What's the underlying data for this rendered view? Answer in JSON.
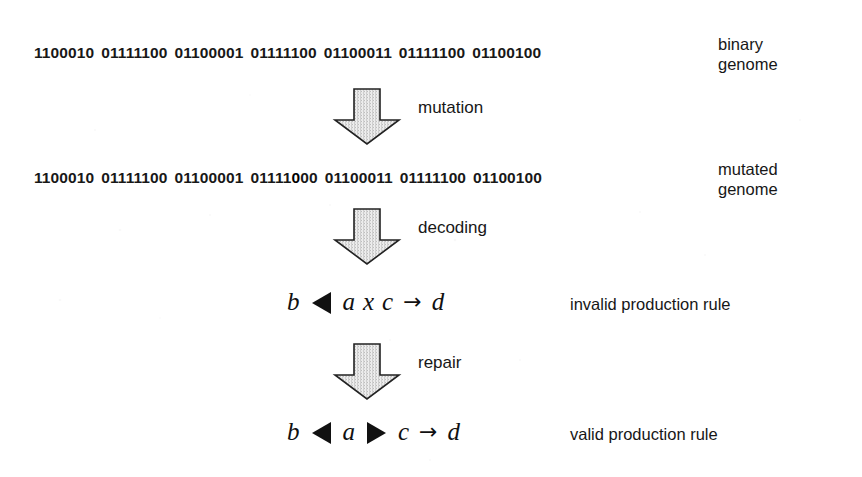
{
  "figure": {
    "background_color": "#ffffff",
    "ink_color": "#171717",
    "arrow_fill_light": "#f2f2f2",
    "arrow_fill_dark": "#b9b9b9",
    "arrow_stroke": "#222222"
  },
  "genomes": {
    "binary": {
      "groups": [
        "1100010",
        "01111100",
        "01100001",
        "01111100",
        "01100011",
        "01111100",
        "01100100"
      ],
      "label_line1": "binary",
      "label_line2": "genome"
    },
    "mutated": {
      "groups_before": [
        "1100010",
        "01111100",
        "01100001"
      ],
      "mutated_group": {
        "prefix": "01111",
        "mutated_bit": "0",
        "suffix": "00"
      },
      "groups_after": [
        "01100011",
        "01111100",
        "01100100"
      ],
      "label_line1": "mutated",
      "label_line2": "genome"
    }
  },
  "stages": [
    {
      "name": "mutation",
      "label": "mutation",
      "icon": "down-block-arrow-icon"
    },
    {
      "name": "decoding",
      "label": "decoding",
      "icon": "down-block-arrow-icon"
    },
    {
      "name": "repair",
      "label": "repair",
      "icon": "down-block-arrow-icon"
    }
  ],
  "rules": {
    "invalid": {
      "tokens": [
        "b",
        "left-triangle",
        "a",
        "x",
        "c",
        "rightarrow",
        "d"
      ],
      "var_b": "b",
      "var_a": "a",
      "var_x": "x",
      "var_c": "c",
      "var_d": "d",
      "arrow_glyph": "→",
      "label": "invalid production rule"
    },
    "valid": {
      "tokens": [
        "b",
        "left-triangle",
        "a",
        "right-triangle",
        "c",
        "rightarrow",
        "d"
      ],
      "var_b": "b",
      "var_a": "a",
      "var_c": "c",
      "var_d": "d",
      "arrow_glyph": "→",
      "label": "valid production rule"
    }
  }
}
